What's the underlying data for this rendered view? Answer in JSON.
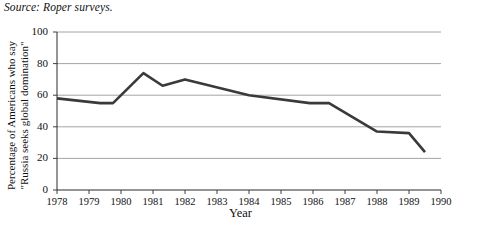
{
  "figure": {
    "source_note": "Source: Roper surveys."
  },
  "chart_data": {
    "type": "line",
    "title": "",
    "source": "Source: Roper surveys.",
    "xlabel": "Year",
    "ylabel": "Percentage of Americans who say \"Russia seeks global domination\"",
    "ylabel_lines": [
      "Percentage of Americans who say",
      "\"Russia seeks global domination\""
    ],
    "xlim": [
      1978,
      1990
    ],
    "ylim": [
      0,
      100
    ],
    "grid": "horizontal",
    "legend": "none",
    "line_color": "#3a3a3a",
    "line_width": 2.6,
    "xticks": [
      1978,
      1979,
      1980,
      1981,
      1982,
      1983,
      1984,
      1985,
      1986,
      1987,
      1988,
      1989,
      1990
    ],
    "xtick_labels": [
      "1978",
      "1979",
      "1980",
      "1981",
      "1982",
      "1983",
      "1984",
      "1985",
      "1986",
      "1987",
      "1988",
      "1989",
      "1990"
    ],
    "yticks": [
      0,
      20,
      40,
      60,
      80,
      100
    ],
    "ytick_labels": [
      "0",
      "20",
      "40",
      "60",
      "80",
      "100"
    ],
    "series": [
      {
        "name": "Russia seeks global domination",
        "x": [
          1978.0,
          1979.35,
          1979.75,
          1980.7,
          1981.3,
          1982.0,
          1984.0,
          1985.9,
          1986.5,
          1988.0,
          1989.0,
          1989.5
        ],
        "values": [
          58,
          55,
          55,
          74,
          66,
          70,
          60,
          55,
          55,
          37,
          36,
          24
        ]
      }
    ]
  }
}
